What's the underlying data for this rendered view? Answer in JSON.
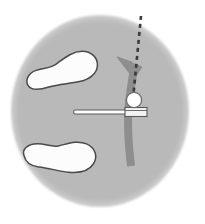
{
  "figure": {
    "type": "anatomical-schematic",
    "canvas": {
      "width": 205,
      "height": 224
    },
    "background_color": "#ffffff"
  },
  "colors": {
    "field_fill": "#b9b9b9",
    "field_edge": "#b0b0b0",
    "footprint_fill": "#fcfcfc",
    "footprint_stroke": "#4a4a4a",
    "arrow_fill": "#8e8e8e",
    "arrow_stroke": "#8e8e8e",
    "dashed_line": "#3a3a3a",
    "joint_fill": "#ffffff",
    "joint_stroke": "#6e6e6e",
    "rod_fill": "#ffffff",
    "rod_stroke": "#5a5a5a",
    "block_fill": "#f2f2f2",
    "block_stroke": "#5a5a5a"
  },
  "elements": {
    "field": {
      "label": "shaded-circular-field",
      "cx": 100,
      "cy": 111,
      "rx": 89,
      "ry": 96
    },
    "footprint_upper": {
      "label": "upper-footprint",
      "cx": 62,
      "cy": 72,
      "rotation_deg": -12
    },
    "footprint_lower": {
      "label": "lower-footprint",
      "cx": 58,
      "cy": 157,
      "rotation_deg": 6
    },
    "dashed_axis": {
      "label": "vertical-reference-axis",
      "x_top": 141,
      "y_top": 16,
      "x_bottom": 133,
      "y_bottom": 98,
      "dash": "4,4",
      "width": 2.6
    },
    "curved_arrow": {
      "label": "rotation-arrow",
      "tip_x": 118,
      "tip_y": 58,
      "tail_x": 131,
      "tail_y": 166,
      "direction": "upward",
      "width": 8
    },
    "joint_marker": {
      "label": "joint-center-circle",
      "cx": 134,
      "cy": 101,
      "r": 7.5
    },
    "horizontal_rod": {
      "label": "tibial-rod",
      "x_left": 73,
      "x_right": 146,
      "y": 112,
      "thickness": 4
    },
    "rod_block": {
      "label": "rod-end-block",
      "x": 125,
      "y": 108,
      "width": 22,
      "height": 9
    }
  },
  "legend": {
    "items": []
  }
}
